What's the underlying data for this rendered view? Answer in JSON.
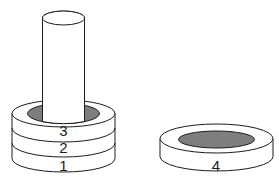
{
  "diagram": {
    "colors": {
      "background": "#ffffff",
      "outline": "#1c1c1c",
      "surface": "#ffffff",
      "hole": "#7e7e7e"
    },
    "tower": {
      "rings_top_to_bottom": [
        {
          "label": "3"
        },
        {
          "label": "2"
        },
        {
          "label": "1"
        }
      ]
    },
    "loose_ring": {
      "label": "4"
    }
  }
}
